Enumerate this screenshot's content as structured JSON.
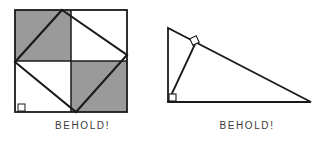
{
  "page": {
    "background_color": "#ffffff",
    "ink_color": "#1a1a1a",
    "shade_color": "#9a9a9a"
  },
  "figures": [
    {
      "id": "dissection-square",
      "caption": "BEHOLD!",
      "type": "geometric-diagram",
      "description": "Square divided into four quadrants with two shaded, and an inscribed tilted square",
      "outer_square": {
        "x": 15,
        "y": 10,
        "width": 112,
        "height": 102,
        "stroke": "#1a1a1a",
        "stroke_width": 1.6,
        "fill": "#ffffff"
      },
      "quadrants": [
        {
          "name": "top-left",
          "x": 15,
          "y": 10,
          "width": 56,
          "height": 51,
          "fill": "#9a9a9a"
        },
        {
          "name": "top-right",
          "x": 71,
          "y": 10,
          "width": 56,
          "height": 51,
          "fill": "#ffffff"
        },
        {
          "name": "bottom-left",
          "x": 15,
          "y": 61,
          "width": 56,
          "height": 51,
          "fill": "#ffffff"
        },
        {
          "name": "bottom-right",
          "x": 71,
          "y": 61,
          "width": 56,
          "height": 51,
          "fill": "#9a9a9a"
        }
      ],
      "median_lines": [
        {
          "name": "horizontal-median",
          "x1": 15,
          "y1": 61,
          "x2": 127,
          "y2": 61
        },
        {
          "name": "vertical-median",
          "x1": 71,
          "y1": 10,
          "x2": 71,
          "y2": 112
        }
      ],
      "inscribed_square_points": "62,10 127,55 76,112 15,62",
      "right_angle_marker": {
        "x": 18,
        "y": 103,
        "size": 7
      }
    },
    {
      "id": "right-triangle-altitude",
      "caption": "BEHOLD!",
      "type": "geometric-diagram",
      "description": "Right triangle with altitude drawn from the right-angle vertex to the hypotenuse",
      "triangle_points": "3,28 3,102 146,102",
      "altitude_line": {
        "x1": 3,
        "y1": 102,
        "x2": 31,
        "y2": 42
      },
      "right_angle_markers": [
        {
          "name": "vertex-right-angle",
          "x": 3,
          "y": 94,
          "size": 8,
          "rotation": 0
        },
        {
          "name": "foot-right-angle",
          "x": 26,
          "y": 37,
          "size": 7,
          "rotation": -25
        }
      ]
    }
  ]
}
